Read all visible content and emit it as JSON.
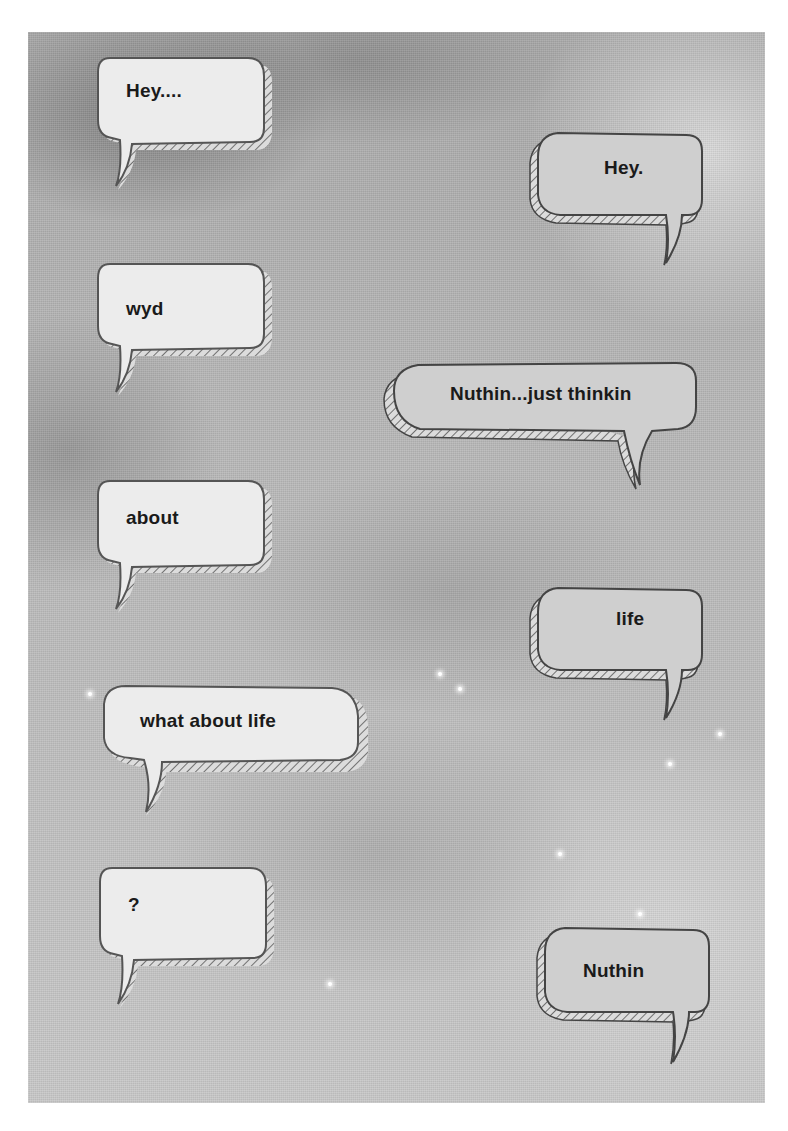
{
  "conversation": {
    "messages": [
      {
        "id": "m1",
        "side": "left",
        "text": "Hey...."
      },
      {
        "id": "m2",
        "side": "right",
        "text": "Hey."
      },
      {
        "id": "m3",
        "side": "left",
        "text": "wyd"
      },
      {
        "id": "m4",
        "side": "right",
        "text": "Nuthin...just thinkin"
      },
      {
        "id": "m5",
        "side": "left",
        "text": "about"
      },
      {
        "id": "m6",
        "side": "right",
        "text": "life"
      },
      {
        "id": "m7",
        "side": "left",
        "text": "what about life"
      },
      {
        "id": "m8",
        "side": "left",
        "text": "?"
      },
      {
        "id": "m9",
        "side": "right",
        "text": "Nuthin"
      }
    ]
  },
  "style": {
    "left_bubble_fill": "#ececec",
    "right_bubble_fill": "#cfcfcf",
    "outline_color": "#4a4a4a",
    "text_color": "#1a1a1a"
  }
}
